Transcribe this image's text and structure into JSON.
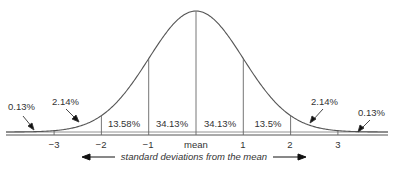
{
  "diagram": {
    "axis_title": "standard deviations from the mean",
    "ticks": [
      "−3",
      "−2",
      "−1",
      "mean",
      "1",
      "2",
      "3"
    ],
    "regions": [
      {
        "label": "0.13%",
        "position": "left tail beyond -3"
      },
      {
        "label": "2.14%",
        "position": "between -3 and -2"
      },
      {
        "label": "13.58%",
        "position": "between -2 and -1"
      },
      {
        "label": "34.13%",
        "position": "between -1 and mean"
      },
      {
        "label": "34.13%",
        "position": "between mean and 1"
      },
      {
        "label": "13.5%",
        "position": "between 1 and 2"
      },
      {
        "label": "2.14%",
        "position": "between 2 and 3"
      },
      {
        "label": "0.13%",
        "position": "right tail beyond 3"
      }
    ],
    "colors": {
      "line": "#555555",
      "text": "#333333",
      "background": "#ffffff"
    }
  }
}
